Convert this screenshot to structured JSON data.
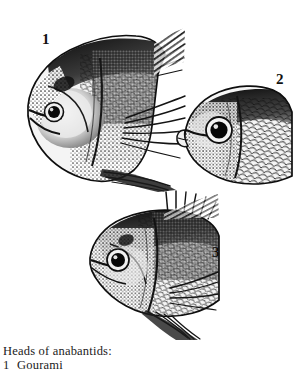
{
  "plate": {
    "background_color": "#ffffff",
    "ink_color": "#111111",
    "medium": "black-and-white engraving / halftone illustration",
    "width": 304,
    "height": 373
  },
  "figures": [
    {
      "number": "1",
      "name": "gourami-head",
      "label": "1",
      "description": "Gourami head in left profile, deep-bodied with long filamentous pectoral ray, dorsal fin and scaled flank"
    },
    {
      "number": "2",
      "name": "anabantid-head-2",
      "label": "2",
      "description": "Anabantid head in left profile with protruding lips, large round dark eye and pale iris ring"
    },
    {
      "number": "3",
      "name": "anabantid-head-3",
      "label": "3",
      "description": "Anabantid head in left profile with spiny dorsal fin, pectoral and pelvic fins"
    }
  ],
  "caption": {
    "title": "Heads of anabantids:",
    "entries": [
      {
        "number": "1",
        "name": "Gourami"
      }
    ]
  }
}
